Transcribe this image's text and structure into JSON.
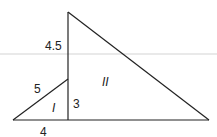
{
  "diagram": {
    "labels": {
      "left_upper_segment": "4.5",
      "hypotenuse_small": "5",
      "vertical_small": "3",
      "base_small": "4",
      "region_small": "I",
      "region_large": "II"
    },
    "colors": {
      "stroke": "#222222",
      "scan_line": "#dddddd"
    }
  }
}
